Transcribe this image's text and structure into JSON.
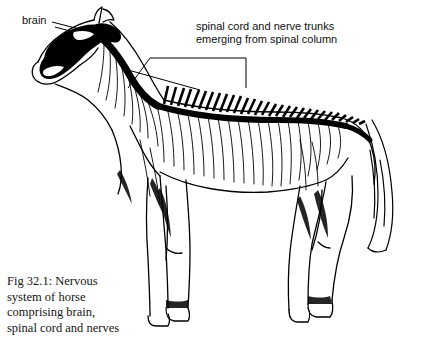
{
  "figure": {
    "type": "anatomical-line-drawing",
    "palette": {
      "background": "#ffffff",
      "ink": "#000000",
      "text": "#101010"
    },
    "annotations": {
      "brain": {
        "text": "brain",
        "leader": "line from label to horse head"
      },
      "spinal": {
        "line1": "spinal cord and nerve trunks",
        "line2": "emerging from spinal column",
        "text": "spinal cord and nerve trunks\nemerging from spinal column",
        "leader": "bracket from label down to spinal column"
      }
    },
    "caption": {
      "line1": "Fig 32.1: Nervous",
      "line2": "system of horse",
      "line3": "comprising brain,",
      "line4": "spinal cord and nerves",
      "text": "Fig 32.1: Nervous\nsystem of horse\ncomprising brain,\nspinal cord and nerves"
    }
  }
}
